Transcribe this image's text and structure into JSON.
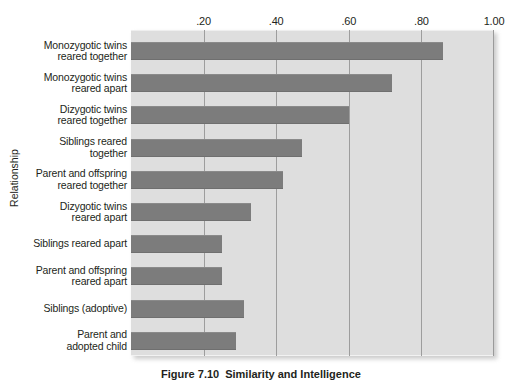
{
  "chart_data": {
    "type": "bar",
    "orientation": "horizontal",
    "title": "",
    "xlabel": "",
    "ylabel": "Relationship",
    "xlim": [
      0,
      1.0
    ],
    "xticks": [
      0.2,
      0.4,
      0.6,
      0.8,
      1.0
    ],
    "xtick_labels": [
      ".20",
      ".40",
      ".60",
      ".80",
      "1.00"
    ],
    "grid": "vertical",
    "legend": "none",
    "bar_color": "#7c7c7c",
    "plot_background": "#dedede",
    "categories": [
      "Monozygotic twins reared together",
      "Monozygotic twins reared apart",
      "Dizygotic twins reared together",
      "Siblings reared together",
      "Parent and offspring reared together",
      "Dizygotic twins reared apart",
      "Siblings reared apart",
      "Parent and offspring reared apart",
      "Siblings (adoptive)",
      "Parent and adopted child"
    ],
    "category_lines": [
      [
        "Monozygotic twins",
        "reared together"
      ],
      [
        "Monozygotic twins",
        "reared apart"
      ],
      [
        "Dizygotic twins",
        "reared together"
      ],
      [
        "Siblings reared",
        "together"
      ],
      [
        "Parent and offspring",
        "reared together"
      ],
      [
        "Dizygotic twins",
        "reared apart"
      ],
      [
        "Siblings reared apart"
      ],
      [
        "Parent and offspring",
        "reared apart"
      ],
      [
        "Siblings (adoptive)"
      ],
      [
        "Parent and",
        "adopted child"
      ]
    ],
    "values": [
      0.86,
      0.72,
      0.6,
      0.47,
      0.42,
      0.33,
      0.25,
      0.25,
      0.31,
      0.29
    ]
  },
  "caption": {
    "number": "Figure 7.10",
    "text": "Similarity and Intelligence"
  }
}
